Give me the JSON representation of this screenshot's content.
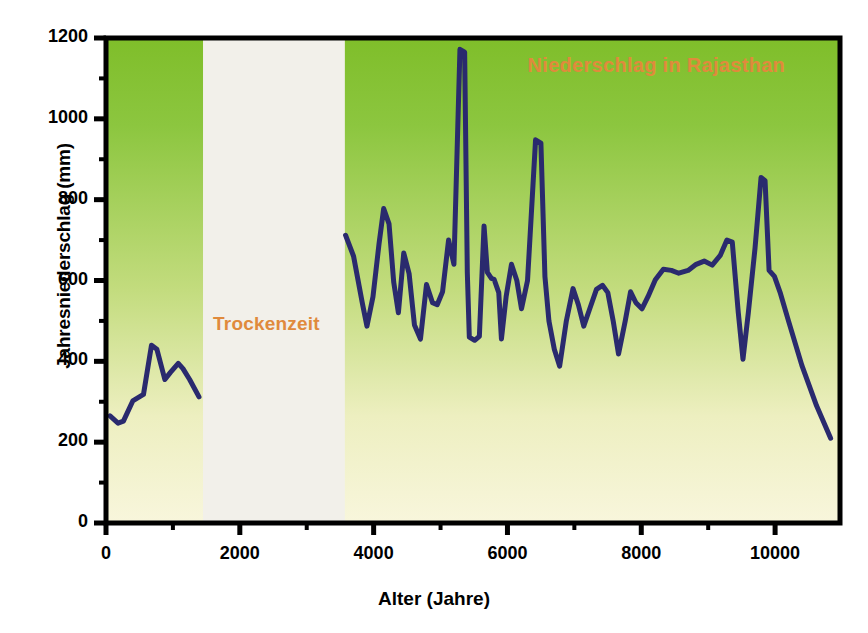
{
  "chart_data": {
    "type": "line",
    "title": "Niederschlag in Rajasthan",
    "xlabel": "Alter (Jahre)",
    "ylabel": "Jahresniederschlag (mm)",
    "xlim": [
      0,
      10970
    ],
    "ylim": [
      0,
      1200
    ],
    "xticks": [
      0,
      2000,
      4000,
      6000,
      8000,
      10000
    ],
    "xtick_labels": [
      "0",
      "2000",
      "4000",
      "6000",
      "8000",
      "10000"
    ],
    "yticks": [
      0,
      200,
      400,
      600,
      800,
      1000,
      1200
    ],
    "ytick_labels": [
      "0",
      "200",
      "400",
      "600",
      "800",
      "1000",
      "1200"
    ],
    "x_minor_tick_step": 1000,
    "y_minor_tick_step": 100,
    "grid": false,
    "legend": null,
    "line_color": "#2a2a6e",
    "line_width_px": 5,
    "plot_bg_gradient_top": "#8CC63F",
    "plot_bg_gradient_bottom": "#F7F5D8",
    "annotations": [
      {
        "name": "dry-period-band",
        "label": "Trockenzeit",
        "label_color": "#E08A3C",
        "x_start": 1450,
        "x_end": 3570,
        "band_color": "#F2F0EA"
      },
      {
        "name": "chart-title-overlay",
        "label": "Niederschlag in Rajasthan",
        "label_color": "#E08A3C"
      }
    ],
    "series": [
      {
        "name": "Jahresniederschlag",
        "segments": [
          {
            "name": "pre-dry-segment",
            "points": [
              [
                60,
                265
              ],
              [
                180,
                247
              ],
              [
                260,
                252
              ],
              [
                400,
                302
              ],
              [
                560,
                318
              ],
              [
                680,
                440
              ],
              [
                760,
                430
              ],
              [
                880,
                355
              ],
              [
                960,
                372
              ],
              [
                1080,
                395
              ],
              [
                1150,
                382
              ],
              [
                1250,
                355
              ],
              [
                1390,
                312
              ]
            ]
          },
          {
            "name": "post-dry-segment",
            "points": [
              [
                3580,
                712
              ],
              [
                3700,
                660
              ],
              [
                3830,
                545
              ],
              [
                3900,
                487
              ],
              [
                3990,
                560
              ],
              [
                4080,
                690
              ],
              [
                4150,
                778
              ],
              [
                4230,
                740
              ],
              [
                4300,
                596
              ],
              [
                4370,
                520
              ],
              [
                4450,
                668
              ],
              [
                4530,
                617
              ],
              [
                4610,
                490
              ],
              [
                4700,
                455
              ],
              [
                4790,
                590
              ],
              [
                4880,
                545
              ],
              [
                4950,
                540
              ],
              [
                5030,
                572
              ],
              [
                5120,
                700
              ],
              [
                5200,
                640
              ],
              [
                5290,
                1172
              ],
              [
                5360,
                1165
              ],
              [
                5400,
                620
              ],
              [
                5430,
                460
              ],
              [
                5510,
                452
              ],
              [
                5580,
                462
              ],
              [
                5650,
                735
              ],
              [
                5700,
                620
              ],
              [
                5760,
                605
              ],
              [
                5800,
                603
              ],
              [
                5870,
                570
              ],
              [
                5910,
                455
              ],
              [
                5980,
                560
              ],
              [
                6060,
                640
              ],
              [
                6140,
                600
              ],
              [
                6210,
                530
              ],
              [
                6300,
                600
              ],
              [
                6420,
                948
              ],
              [
                6500,
                940
              ],
              [
                6560,
                610
              ],
              [
                6620,
                500
              ],
              [
                6700,
                430
              ],
              [
                6780,
                388
              ],
              [
                6880,
                500
              ],
              [
                6980,
                580
              ],
              [
                7060,
                540
              ],
              [
                7140,
                487
              ],
              [
                7230,
                530
              ],
              [
                7330,
                578
              ],
              [
                7420,
                588
              ],
              [
                7500,
                570
              ],
              [
                7580,
                500
              ],
              [
                7660,
                418
              ],
              [
                7760,
                500
              ],
              [
                7840,
                572
              ],
              [
                7920,
                545
              ],
              [
                8010,
                530
              ],
              [
                8100,
                560
              ],
              [
                8210,
                602
              ],
              [
                8330,
                628
              ],
              [
                8450,
                625
              ],
              [
                8560,
                618
              ],
              [
                8700,
                625
              ],
              [
                8820,
                640
              ],
              [
                8940,
                648
              ],
              [
                9060,
                638
              ],
              [
                9180,
                662
              ],
              [
                9280,
                700
              ],
              [
                9360,
                695
              ],
              [
                9450,
                520
              ],
              [
                9520,
                405
              ],
              [
                9600,
                520
              ],
              [
                9700,
                680
              ],
              [
                9790,
                855
              ],
              [
                9850,
                847
              ],
              [
                9910,
                625
              ],
              [
                9990,
                610
              ],
              [
                10080,
                568
              ],
              [
                10200,
                500
              ],
              [
                10400,
                390
              ],
              [
                10620,
                290
              ],
              [
                10830,
                210
              ]
            ]
          }
        ]
      }
    ]
  }
}
